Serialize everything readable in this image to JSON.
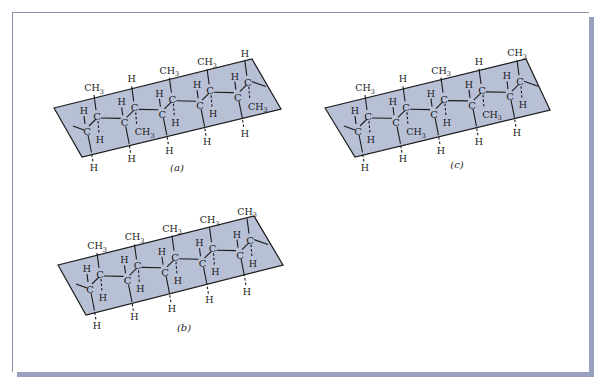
{
  "figure": {
    "panels": [
      {
        "id": "a",
        "caption": "(a)",
        "caption_pos": [
          177,
          171
        ],
        "plane": [
          [
            54,
            108
          ],
          [
            252,
            59
          ],
          [
            281,
            109
          ],
          [
            82,
            157
          ]
        ],
        "start": [
          87,
          132
        ],
        "step": [
          37.7,
          -8.6
        ],
        "units": [
          {
            "up": "CH3",
            "down": "H"
          },
          {
            "up": "H",
            "down": "CH3"
          },
          {
            "up": "CH3",
            "down": "H"
          },
          {
            "up": "CH3",
            "down": "H"
          },
          {
            "up": "H",
            "down": "CH3"
          }
        ],
        "end_tail": true
      },
      {
        "id": "b",
        "caption": "(b)",
        "caption_pos": [
          184,
          331
        ],
        "plane": [
          [
            58,
            265
          ],
          [
            254,
            216
          ],
          [
            283,
            265
          ],
          [
            86,
            315
          ]
        ],
        "start": [
          90,
          290
        ],
        "step": [
          37.5,
          -8.6
        ],
        "units": [
          {
            "up": "CH3",
            "down": "H"
          },
          {
            "up": "CH3",
            "down": "H"
          },
          {
            "up": "CH3",
            "down": "H"
          },
          {
            "up": "CH3",
            "down": "H"
          },
          {
            "up": "CH3",
            "down": "H"
          }
        ],
        "end_tail": true
      },
      {
        "id": "c",
        "caption": "(c)",
        "caption_pos": [
          457,
          168
        ],
        "plane": [
          [
            325,
            108
          ],
          [
            526,
            59
          ],
          [
            550,
            110
          ],
          [
            355,
            157
          ]
        ],
        "start": [
          358,
          132
        ],
        "step": [
          38,
          -8.7
        ],
        "units": [
          {
            "up": "CH3",
            "down": "H"
          },
          {
            "up": "H",
            "down": "CH3"
          },
          {
            "up": "CH3",
            "down": "H"
          },
          {
            "up": "H",
            "down": "CH3"
          },
          {
            "up": "CH3",
            "down": "H"
          }
        ],
        "end_tail": true
      }
    ],
    "atom_labels": {
      "carbon": "C",
      "hydrogen": "H",
      "methyl": "CH",
      "methyl_subscript": "3"
    },
    "colors": {
      "plane_fill": "#b8c0d6",
      "line": "#1a1a1a",
      "frame_border": "#8a90a8",
      "frame_shadow": "#9aa0bf"
    }
  }
}
